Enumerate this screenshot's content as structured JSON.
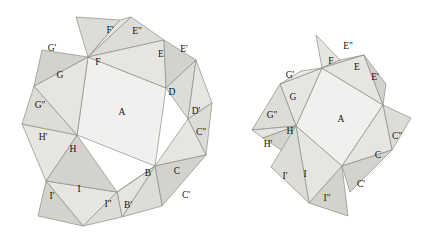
{
  "figure": {
    "background_color": "#ffffff",
    "stroke_color": "#8d8d86",
    "label_color": "#111111",
    "fills": {
      "core": "#f1f0ee",
      "light": "#e6e5e1",
      "mid": "#dedcd7",
      "dark": "#d4d2cc",
      "pale": "#ebeae6"
    }
  },
  "left_figure": {
    "name": "folded-nonagon",
    "labels": [
      {
        "text": "A",
        "x": 122,
        "y": 113
      },
      {
        "text": "B",
        "x": 148,
        "y": 174
      },
      {
        "text": "B'",
        "x": 128,
        "y": 206
      },
      {
        "text": "C",
        "x": 177,
        "y": 172
      },
      {
        "text": "C'",
        "x": 186,
        "y": 196
      },
      {
        "text": "C\"",
        "x": 201,
        "y": 133
      },
      {
        "text": "D",
        "x": 172,
        "y": 93
      },
      {
        "text": "D'",
        "x": 196,
        "y": 112
      },
      {
        "text": "E",
        "x": 161,
        "y": 55
      },
      {
        "text": "E'",
        "x": 184,
        "y": 50
      },
      {
        "text": "E\"",
        "x": 137,
        "y": 32
      },
      {
        "text": "F",
        "x": 98,
        "y": 63
      },
      {
        "text": "F'",
        "x": 110,
        "y": 31
      },
      {
        "text": "G",
        "x": 60,
        "y": 76
      },
      {
        "text": "G'",
        "x": 52,
        "y": 49
      },
      {
        "text": "G\"",
        "x": 40,
        "y": 106
      },
      {
        "text": "H",
        "x": 73,
        "y": 150
      },
      {
        "text": "H'",
        "x": 43,
        "y": 138
      },
      {
        "text": "I",
        "x": 79,
        "y": 190
      },
      {
        "text": "I'",
        "x": 52,
        "y": 197
      },
      {
        "text": "I\"",
        "x": 108,
        "y": 205
      }
    ]
  },
  "right_figure": {
    "name": "unfolded-net",
    "labels": [
      {
        "text": "A",
        "x": 341,
        "y": 120
      },
      {
        "text": "C",
        "x": 378,
        "y": 156
      },
      {
        "text": "C'",
        "x": 361,
        "y": 185
      },
      {
        "text": "C\"",
        "x": 397,
        "y": 137
      },
      {
        "text": "E",
        "x": 357,
        "y": 68
      },
      {
        "text": "E'",
        "x": 375,
        "y": 78
      },
      {
        "text": "E\"",
        "x": 348,
        "y": 47
      },
      {
        "text": "F",
        "x": 331,
        "y": 62
      },
      {
        "text": "G",
        "x": 293,
        "y": 98
      },
      {
        "text": "G'",
        "x": 290,
        "y": 76
      },
      {
        "text": "G\"",
        "x": 272,
        "y": 116
      },
      {
        "text": "H",
        "x": 290,
        "y": 132
      },
      {
        "text": "H'",
        "x": 268,
        "y": 145
      },
      {
        "text": "I",
        "x": 305,
        "y": 175
      },
      {
        "text": "I'",
        "x": 285,
        "y": 177
      },
      {
        "text": "I\"",
        "x": 327,
        "y": 199
      }
    ]
  }
}
